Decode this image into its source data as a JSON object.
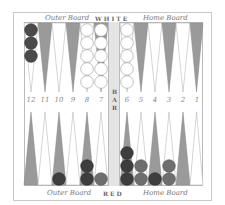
{
  "board": {
    "top_labels": {
      "outer": "Outer Board",
      "player": "WHITE",
      "home": "Home Board"
    },
    "bottom_labels": {
      "outer": "Outer Board",
      "player": "RED",
      "home": "Home Board"
    },
    "bar_label": "BAR",
    "bar_letters": [
      "B",
      "A",
      "R"
    ],
    "point_numbers_left": [
      "12",
      "11",
      "10",
      "9",
      "8",
      "7"
    ],
    "point_numbers_right": [
      "6",
      "5",
      "4",
      "3",
      "2",
      "1"
    ],
    "colors": {
      "dark_point": "#9a9a9a",
      "light_point": "#ffffff",
      "red_checker_dark": "#4a4a4a",
      "red_checker_medium": "#6e6e6e",
      "white_checker": "#ffffff",
      "bar": "#e4e4e4"
    },
    "checkers": {
      "top": [
        {
          "point": 13,
          "color": "red",
          "count": 3
        },
        {
          "point": 17,
          "color": "white",
          "count": 5
        },
        {
          "point": 18,
          "color": "white",
          "count": 5
        },
        {
          "point": 19,
          "color": "white",
          "count": 5
        }
      ],
      "bottom": [
        {
          "point": 10,
          "color": "red",
          "count": 1
        },
        {
          "point": 8,
          "color": "red",
          "count": 2
        },
        {
          "point": 7,
          "color": "red",
          "count": 1
        },
        {
          "point": 6,
          "color": "red",
          "count": 3
        },
        {
          "point": 5,
          "color": "red",
          "count": 2
        },
        {
          "point": 4,
          "color": "red",
          "count": 1
        },
        {
          "point": 3,
          "color": "red",
          "count": 2
        }
      ]
    }
  }
}
